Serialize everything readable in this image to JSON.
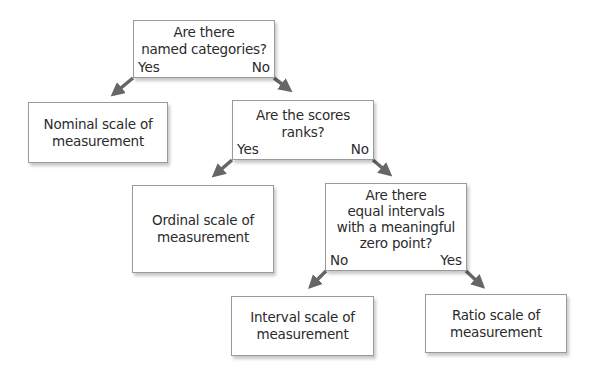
{
  "diagram": {
    "questions": [
      {
        "id": "q1",
        "lines": [
          "Are there",
          "named categories?"
        ],
        "yes_label": "Yes",
        "no_label": "No"
      },
      {
        "id": "q2",
        "lines": [
          "Are the scores",
          "ranks?"
        ],
        "yes_label": "Yes",
        "no_label": "No"
      },
      {
        "id": "q3",
        "lines": [
          "Are there",
          "equal intervals",
          "with a meaningful",
          "zero point?"
        ],
        "no_label": "No",
        "yes_label": "Yes"
      }
    ],
    "results": [
      {
        "id": "nominal",
        "lines": [
          "Nominal scale of",
          "measurement"
        ]
      },
      {
        "id": "ordinal",
        "lines": [
          "Ordinal scale of",
          "measurement"
        ]
      },
      {
        "id": "interval",
        "lines": [
          "Interval scale of",
          "measurement"
        ]
      },
      {
        "id": "ratio",
        "lines": [
          "Ratio scale of",
          "measurement"
        ]
      }
    ],
    "edges": [
      {
        "from": "q1",
        "to": "nominal",
        "label": "Yes"
      },
      {
        "from": "q1",
        "to": "q2",
        "label": "No"
      },
      {
        "from": "q2",
        "to": "ordinal",
        "label": "Yes"
      },
      {
        "from": "q2",
        "to": "q3",
        "label": "No"
      },
      {
        "from": "q3",
        "to": "interval",
        "label": "No"
      },
      {
        "from": "q3",
        "to": "ratio",
        "label": "Yes"
      }
    ],
    "colors": {
      "arrow": "#666666",
      "border": "#9a9a9a",
      "text": "#2b2b2b"
    }
  }
}
